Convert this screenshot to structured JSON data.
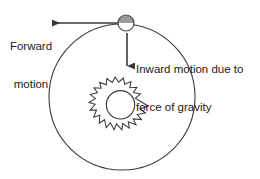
{
  "diagram": {
    "background_color": "#ffffff",
    "stroke_color": "#3a3a3a",
    "text_color": "#1a1a1a",
    "planet_fill_top": "#9a9a9a",
    "planet_fill_bottom": "#ffffff",
    "sun_fill": "#ffffff",
    "labels": {
      "forward_motion": {
        "line1": "Forward",
        "line2": "motion"
      },
      "inward_motion": {
        "line1": "Inward motion due to",
        "line2": "force of gravity"
      }
    },
    "elements": {
      "orbit_name": "orbit-circle",
      "planet_name": "planet-body",
      "sun_name": "sun-body",
      "forward_arrow_name": "forward-motion-arrow",
      "gravity_arrow_name": "gravity-arrow"
    },
    "geometry": {
      "orbit_center_x": 122,
      "orbit_center_y": 97,
      "orbit_radius": 73,
      "planet_x": 126,
      "planet_y": 23,
      "planet_radius": 8,
      "sun_x": 127,
      "sun_y": 106,
      "sun_radius": 14,
      "sun_spikes": 18,
      "forward_arrow_from_x": 120,
      "forward_arrow_to_x": 50,
      "forward_arrow_y": 23,
      "gravity_arrow_x": 127,
      "gravity_arrow_from_y": 33,
      "gravity_arrow_to_y": 68
    }
  }
}
